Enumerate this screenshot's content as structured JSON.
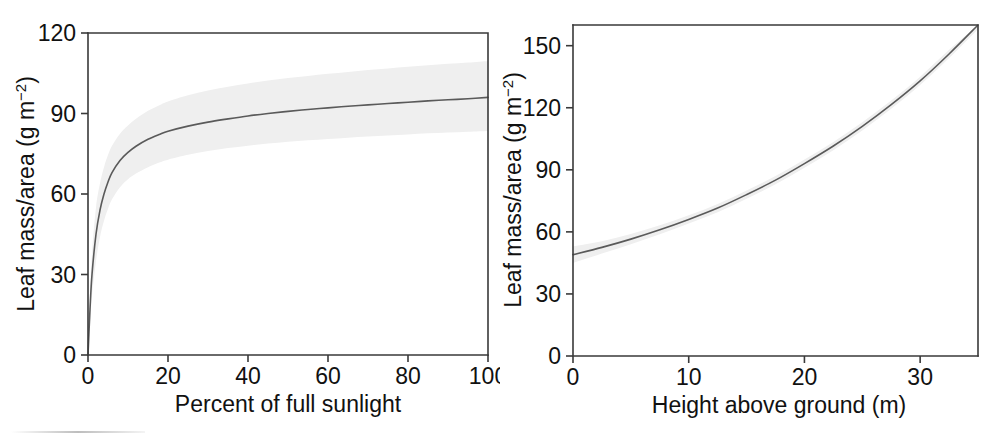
{
  "figure": {
    "background_color": "#ffffff",
    "curve_color": "#5a5a5a",
    "band_color": "#efefef",
    "axis_color": "#3a3a3a",
    "panels": [
      "left",
      "right"
    ]
  },
  "chart_data": [
    {
      "type": "line",
      "panel": "left",
      "title": "",
      "xlabel": "Percent of full sunlight",
      "ylabel": "Leaf mass/area (g m⁻²)",
      "ylabel_parts": {
        "main": "Leaf mass/area (g m",
        "sup": "−2",
        "tail": ")"
      },
      "xlim": [
        0,
        100
      ],
      "ylim": [
        0,
        120
      ],
      "xticks": [
        0,
        20,
        40,
        60,
        80,
        100
      ],
      "yticks": [
        0,
        30,
        60,
        90,
        120
      ],
      "xticklabels": [
        "0",
        "20",
        "40",
        "60",
        "80",
        "100"
      ],
      "yticklabels": [
        "0",
        "30",
        "60",
        "90",
        "120"
      ],
      "grid": false,
      "legend": null,
      "x": [
        0,
        0.5,
        1,
        2,
        3,
        4,
        5,
        6,
        8,
        10,
        12,
        15,
        18,
        20,
        25,
        30,
        35,
        40,
        45,
        50,
        55,
        60,
        65,
        70,
        75,
        80,
        85,
        90,
        95,
        100
      ],
      "series": [
        {
          "name": "fit",
          "values": [
            0,
            17,
            30,
            45,
            54,
            60,
            64.5,
            68,
            72.5,
            75.5,
            77.8,
            80.4,
            82.3,
            83.4,
            85.3,
            86.8,
            88.0,
            89.1,
            90.0,
            90.8,
            91.5,
            92.1,
            92.7,
            93.2,
            93.7,
            94.2,
            94.7,
            95.1,
            95.5,
            96.0
          ]
        },
        {
          "name": "ci_upper",
          "values": [
            0,
            22,
            38,
            55,
            64,
            70,
            74.5,
            78,
            82.5,
            85.5,
            88.0,
            91.0,
            93.2,
            94.5,
            96.8,
            98.6,
            100.0,
            101.2,
            102.3,
            103.2,
            104.0,
            104.8,
            105.5,
            106.2,
            106.8,
            107.4,
            108.0,
            108.5,
            109.0,
            109.6
          ]
        },
        {
          "name": "ci_lower",
          "values": [
            0,
            12,
            22,
            35,
            44,
            50,
            54.5,
            58,
            62.5,
            65.5,
            67.6,
            70.0,
            71.8,
            72.8,
            74.6,
            76.0,
            77.1,
            78.0,
            78.8,
            79.5,
            80.0,
            80.5,
            81.0,
            81.4,
            81.8,
            82.2,
            82.6,
            82.9,
            83.2,
            83.5
          ]
        }
      ]
    },
    {
      "type": "line",
      "panel": "right",
      "title": "",
      "xlabel": "Height above ground (m)",
      "ylabel": "Leaf mass/area (g m⁻²)",
      "ylabel_parts": {
        "main": "Leaf mass/area (g m",
        "sup": "−2",
        "tail": ")"
      },
      "xlim": [
        0,
        35
      ],
      "ylim": [
        0,
        160
      ],
      "xticks": [
        0,
        10,
        20,
        30
      ],
      "yticks": [
        0,
        30,
        60,
        90,
        120,
        150
      ],
      "xticklabels": [
        "0",
        "10",
        "20",
        "30"
      ],
      "yticklabels": [
        "0",
        "30",
        "60",
        "90",
        "120",
        "150"
      ],
      "grid": false,
      "legend": null,
      "x": [
        0,
        2.5,
        5,
        7.5,
        10,
        12.5,
        15,
        17.5,
        20,
        22.5,
        25,
        27.5,
        30,
        32.5,
        35
      ],
      "series": [
        {
          "name": "fit",
          "values": [
            49.0,
            52.5,
            56.5,
            61.0,
            66.0,
            71.5,
            78.0,
            85.0,
            93.0,
            101.5,
            111.0,
            121.5,
            133.0,
            146.0,
            160.0
          ]
        },
        {
          "name": "ci_upper",
          "values": [
            53.0,
            55.5,
            59.0,
            63.2,
            68.0,
            73.5,
            80.0,
            87.0,
            95.0,
            103.5,
            113.0,
            123.5,
            135.0,
            148.0,
            162.0
          ]
        },
        {
          "name": "ci_lower",
          "values": [
            45.0,
            49.5,
            54.0,
            58.8,
            64.0,
            69.5,
            76.0,
            83.0,
            91.0,
            99.5,
            109.0,
            119.5,
            131.0,
            144.0,
            158.0
          ]
        }
      ]
    }
  ]
}
